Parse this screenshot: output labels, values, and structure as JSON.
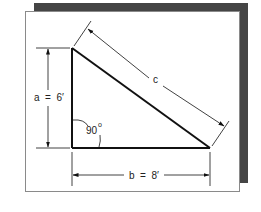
{
  "diagram": {
    "type": "right-triangle",
    "labels": {
      "side_a": "a  =  6′",
      "side_b": "b  =  8′",
      "hypotenuse": "c",
      "angle": "90",
      "angle_unit": "o"
    },
    "values": {
      "a": "6'",
      "b": "8'",
      "angle_deg": 90
    },
    "colors": {
      "line": "#111111",
      "shadow": "#454545",
      "panel": "#ffffff",
      "panel_border": "#8a8a8a"
    }
  }
}
